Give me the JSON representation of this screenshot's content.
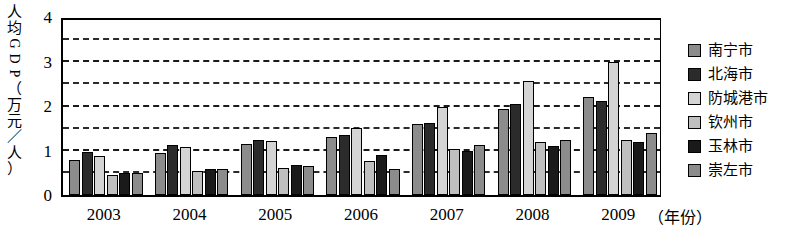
{
  "chart_data": {
    "type": "bar",
    "title": "",
    "subtitle": "",
    "xlabel": "（年份）",
    "ylabel": "人均GDP（万元/人）",
    "categories": [
      "2003",
      "2004",
      "2005",
      "2006",
      "2007",
      "2008",
      "2009"
    ],
    "ylim": [
      0,
      4
    ],
    "yticks": [
      "0",
      "1",
      "2",
      "3",
      "4"
    ],
    "minor_gridlines": [
      0.5,
      1.5,
      2.5,
      3.5
    ],
    "grid": true,
    "legend_position": "right",
    "series": [
      {
        "name": "南宁市",
        "color": "#8c8c8c",
        "values": [
          0.8,
          0.95,
          1.15,
          1.32,
          1.6,
          1.95,
          2.22
        ]
      },
      {
        "name": "北海市",
        "color": "#2b2b2b",
        "values": [
          0.97,
          1.12,
          1.25,
          1.35,
          1.62,
          2.05,
          2.12
        ]
      },
      {
        "name": "防城港市",
        "color": "#d4d4d4",
        "values": [
          0.88,
          1.08,
          1.22,
          1.52,
          1.98,
          2.58,
          3.0
        ]
      },
      {
        "name": "钦州市",
        "color": "#bfbfbf",
        "values": [
          0.45,
          0.55,
          0.6,
          0.78,
          1.05,
          1.2,
          1.25
        ]
      },
      {
        "name": "玉林市",
        "color": "#1a1a1a",
        "values": [
          0.5,
          0.58,
          0.68,
          0.9,
          1.0,
          1.1,
          1.2
        ]
      },
      {
        "name": "崇左市",
        "color": "#8c8c8c",
        "values": [
          0.5,
          0.58,
          0.65,
          0.58,
          1.12,
          1.25,
          1.4
        ]
      }
    ]
  },
  "axis": {
    "y_title_chars": [
      "人",
      "均",
      "G",
      "D",
      "P",
      "（",
      "万",
      "元",
      "／",
      "人",
      "）"
    ],
    "y_tick_labels": [
      "4",
      "3",
      "2",
      "1",
      "0"
    ],
    "x_unit_label": "（年份）"
  },
  "legend": {
    "items": [
      {
        "label": "南宁市",
        "swatch": "#8c8c8c"
      },
      {
        "label": "北海市",
        "swatch": "#2b2b2b"
      },
      {
        "label": "防城港市",
        "swatch": "#d4d4d4"
      },
      {
        "label": "钦州市",
        "swatch": "#bfbfbf"
      },
      {
        "label": "玉林市",
        "swatch": "#1a1a1a"
      },
      {
        "label": "崇左市",
        "swatch": "#8c8c8c"
      }
    ]
  }
}
